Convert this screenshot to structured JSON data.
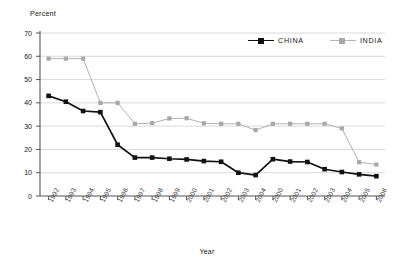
{
  "chart_data": {
    "type": "line",
    "title": "",
    "xlabel": "Year",
    "ylabel": "Percent",
    "ylim": [
      0,
      70
    ],
    "ytick_step": 10,
    "yticks": [
      0,
      10,
      20,
      30,
      40,
      50,
      60,
      70
    ],
    "grid": "horizontal",
    "legend_position": "top-right",
    "categories": [
      "1992",
      "1993",
      "1994",
      "1995",
      "1996",
      "1997",
      "1998",
      "1999",
      "2000",
      "2001",
      "2002",
      "2003",
      "2004",
      "2000",
      "2001",
      "2002",
      "2003",
      "2004",
      "2005",
      "2006"
    ],
    "series": [
      {
        "name": "CHINA",
        "color": "#111111",
        "marker": "square",
        "values": [
          43,
          40.5,
          36.5,
          36,
          22,
          16.5,
          16.5,
          16,
          15.7,
          15,
          14.7,
          10,
          9,
          15.8,
          14.8,
          14.6,
          11.5,
          10.3,
          9.3,
          8.5
        ]
      },
      {
        "name": "INDIA",
        "color": "#a8a8a8",
        "marker": "square",
        "values": [
          59,
          59,
          59,
          40,
          40,
          31,
          31.3,
          33.3,
          33.4,
          31.2,
          31,
          31,
          28.3,
          31,
          31,
          31,
          31,
          29,
          14.5,
          13.5
        ]
      }
    ]
  },
  "legend": {
    "entries": [
      {
        "label": "CHINA",
        "color": "#111111"
      },
      {
        "label": "INDIA",
        "color": "#a8a8a8"
      }
    ]
  },
  "axes": {
    "y_title": "Percent",
    "x_title": "Year"
  }
}
